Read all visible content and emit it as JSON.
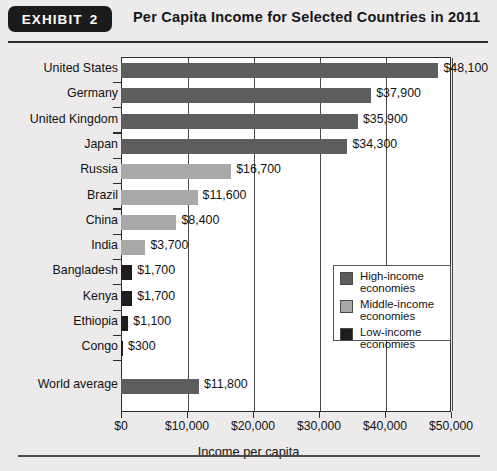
{
  "header": {
    "badge_label": "EXHIBIT",
    "badge_number": "2",
    "title": "Per Capita Income for Selected Countries in 2011"
  },
  "legend": {
    "items": [
      {
        "label_line1": "High-income",
        "label_line2": "economies",
        "group": "high",
        "color": "#5d5d5d"
      },
      {
        "label_line1": "Middle-income",
        "label_line2": "economies",
        "group": "middle",
        "color": "#a9a9a9"
      },
      {
        "label_line1": "Low-income",
        "label_line2": "economies",
        "group": "low",
        "color": "#1d1d1d"
      }
    ]
  },
  "chart_data": {
    "type": "bar",
    "orientation": "horizontal",
    "title": "Per Capita Income for Selected Countries in 2011",
    "xlabel": "Income per capita",
    "ylabel": "",
    "xlim": [
      0,
      50000
    ],
    "grid": true,
    "legend_position": "center-right",
    "xticks": [
      0,
      10000,
      20000,
      30000,
      40000,
      50000
    ],
    "xticklabels": [
      "$0",
      "$10,000",
      "$20,000",
      "$30,000",
      "$40,000",
      "$50,000"
    ],
    "categories": [
      "United States",
      "Germany",
      "United Kingdom",
      "Japan",
      "Russia",
      "Brazil",
      "China",
      "India",
      "Bangladesh",
      "Kenya",
      "Ethiopia",
      "Congo",
      "World average"
    ],
    "values": [
      48100,
      37900,
      35900,
      34300,
      16700,
      11600,
      8400,
      3700,
      1700,
      1700,
      1100,
      300,
      11800
    ],
    "value_labels": [
      "$48,100",
      "$37,900",
      "$35,900",
      "$34,300",
      "$16,700",
      "$11,600",
      "$8,400",
      "$3,700",
      "$1,700",
      "$1,700",
      "$1,100",
      "$300",
      "$11,800"
    ],
    "groups": [
      "high",
      "high",
      "high",
      "high",
      "middle",
      "middle",
      "middle",
      "middle",
      "low",
      "low",
      "low",
      "low",
      "high"
    ],
    "series": [
      {
        "name": "High-income economies",
        "color": "#5d5d5d"
      },
      {
        "name": "Middle-income economies",
        "color": "#a9a9a9"
      },
      {
        "name": "Low-income economies",
        "color": "#1d1d1d"
      }
    ]
  }
}
